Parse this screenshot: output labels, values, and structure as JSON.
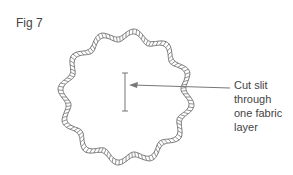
{
  "figure": {
    "label": "Fig 7",
    "callout_line1": "Cut slit through",
    "callout_line2": "one fabric layer"
  },
  "shape": {
    "type": "scalloped-circle",
    "lobes": 12,
    "cx": 126,
    "cy": 97,
    "r": 62
  },
  "colors": {
    "stroke": "#777777",
    "text": "#444444"
  }
}
